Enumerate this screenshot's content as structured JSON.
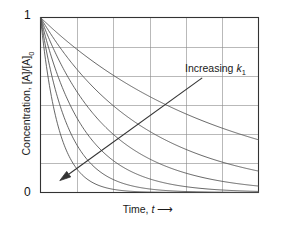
{
  "chart_data": {
    "type": "line",
    "title": "",
    "subtitle": "",
    "xlabel": "Time, t",
    "xlabel_text": "Time,",
    "xlabel_var": "t",
    "xlabel_arrow": "⟶",
    "ylabel": "Concentration, [A]/[A]0",
    "ylabel_main": "Concentration, [A]/[A]",
    "ylabel_sub": "0",
    "xlim": [
      0,
      6
    ],
    "ylim": [
      0,
      1
    ],
    "xticks": [],
    "yticks": [
      0,
      1
    ],
    "ytick_labels": [
      "0",
      "1"
    ],
    "xtick_labels": [],
    "grid": true,
    "grid_x_lines": [
      1,
      2,
      3,
      4,
      5
    ],
    "grid_y_lines": [
      0.1667,
      0.3333,
      0.5,
      0.6667,
      0.8333
    ],
    "legend": "none",
    "legend_position": "none",
    "annotations": [
      {
        "name": "increasing-rate-constant",
        "text": "Increasing k",
        "text_main": "Increasing",
        "text_var": "k",
        "text_sub": "1",
        "arrow_from": [
          4.45,
          0.655
        ],
        "arrow_to": [
          0.53,
          0.068
        ],
        "arrow_direction": "down-left"
      }
    ],
    "series": [
      {
        "name": "k = 0.20",
        "rate_constant": 0.2,
        "x": [
          0,
          0.5,
          1,
          1.5,
          2,
          2.5,
          3,
          3.5,
          4,
          4.5,
          5,
          5.5,
          6
        ],
        "values": [
          1.0,
          0.905,
          0.819,
          0.741,
          0.67,
          0.607,
          0.549,
          0.497,
          0.449,
          0.407,
          0.368,
          0.333,
          0.301
        ]
      },
      {
        "name": "k = 0.35",
        "rate_constant": 0.35,
        "x": [
          0,
          0.5,
          1,
          1.5,
          2,
          2.5,
          3,
          3.5,
          4,
          4.5,
          5,
          5.5,
          6
        ],
        "values": [
          1.0,
          0.839,
          0.705,
          0.592,
          0.497,
          0.417,
          0.35,
          0.294,
          0.247,
          0.207,
          0.174,
          0.146,
          0.122
        ]
      },
      {
        "name": "k = 0.55",
        "rate_constant": 0.55,
        "x": [
          0,
          0.5,
          1,
          1.5,
          2,
          2.5,
          3,
          3.5,
          4,
          4.5,
          5,
          5.5,
          6
        ],
        "values": [
          1.0,
          0.76,
          0.577,
          0.438,
          0.333,
          0.253,
          0.192,
          0.146,
          0.111,
          0.084,
          0.064,
          0.049,
          0.037
        ]
      },
      {
        "name": "k = 0.85",
        "rate_constant": 0.85,
        "x": [
          0,
          0.5,
          1,
          1.5,
          2,
          2.5,
          3,
          3.5,
          4,
          4.5,
          5,
          5.5,
          6
        ],
        "values": [
          1.0,
          0.654,
          0.427,
          0.279,
          0.183,
          0.119,
          0.078,
          0.051,
          0.033,
          0.022,
          0.014,
          0.009,
          0.006
        ]
      },
      {
        "name": "k = 1.30",
        "rate_constant": 1.3,
        "x": [
          0,
          0.5,
          1,
          1.5,
          2,
          2.5,
          3,
          3.5,
          4,
          4.5,
          5,
          5.5,
          6
        ],
        "values": [
          1.0,
          0.522,
          0.273,
          0.142,
          0.074,
          0.039,
          0.02,
          0.011,
          0.006,
          0.003,
          0.002,
          0.001,
          0.0
        ]
      },
      {
        "name": "k = 2.00",
        "rate_constant": 2.0,
        "x": [
          0,
          0.5,
          1,
          1.5,
          2,
          2.5,
          3,
          3.5,
          4,
          4.5,
          5,
          5.5,
          6
        ],
        "values": [
          1.0,
          0.368,
          0.135,
          0.05,
          0.018,
          0.007,
          0.002,
          0.001,
          0.0,
          0.0,
          0.0,
          0.0,
          0.0
        ]
      }
    ],
    "colors": {
      "curve": "#4a4a4a",
      "grid": "#8a8a8a",
      "axis": "#333333",
      "text": "#111111",
      "background": "#ffffff"
    }
  }
}
